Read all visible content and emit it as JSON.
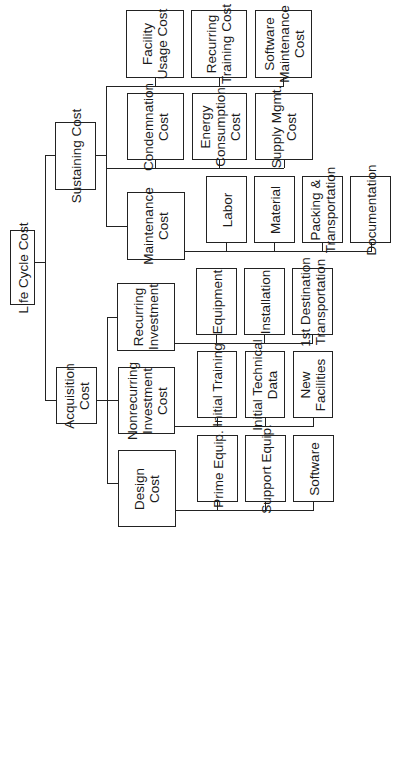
{
  "diagram": {
    "type": "hierarchy",
    "orientation": "rotated-90-ccw",
    "root": {
      "label": "Life Cycle Cost",
      "children": [
        {
          "label": "Sustaining Cost",
          "children": [
            {
              "label": "Facility\nUsage Cost"
            },
            {
              "label": "Recurring\nTraining Cost"
            },
            {
              "label": "Software\nMaintenance\nCost"
            },
            {
              "label": "Condemnation\nCost"
            },
            {
              "label": "Energy\nConsumption\nCost"
            },
            {
              "label": "Supply Mgmt.\nCost"
            },
            {
              "label": "Maintenance\nCost",
              "children": [
                {
                  "label": "Labor"
                },
                {
                  "label": "Material"
                },
                {
                  "label": "Packing &\nTransportation"
                },
                {
                  "label": "Documentation"
                }
              ]
            }
          ]
        },
        {
          "label": "Acquisition\nCost",
          "children": [
            {
              "label": "Recurring\nInvestment",
              "children": [
                {
                  "label": "Equipment"
                },
                {
                  "label": "Installation"
                },
                {
                  "label": "1st Destination\nTransportation"
                }
              ]
            },
            {
              "label": "Nonrecurring\nInvestment\nCost",
              "children": [
                {
                  "label": "Initial Training"
                },
                {
                  "label": "Initial Technical\nData"
                },
                {
                  "label": "New\nFacilities"
                }
              ]
            },
            {
              "label": "Design\nCost",
              "children": [
                {
                  "label": "Prime Equip."
                },
                {
                  "label": "Support Equip."
                },
                {
                  "label": "Software"
                }
              ]
            }
          ]
        }
      ]
    }
  }
}
